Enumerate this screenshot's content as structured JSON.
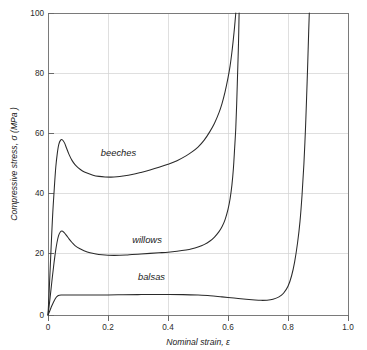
{
  "chart_data": {
    "type": "line",
    "title": "",
    "xlabel": "Nominal strain, ε",
    "ylabel": "Compressive stress, σ (MPa )",
    "xlim": [
      0,
      1.0
    ],
    "ylim": [
      0,
      100
    ],
    "xticks": [
      "0",
      "0.2",
      "0.4",
      "0.6",
      "0.8",
      "1.0"
    ],
    "xtick_values": [
      0,
      0.2,
      0.4,
      0.6,
      0.8,
      1.0
    ],
    "yticks": [
      "0",
      "20",
      "40",
      "60",
      "80",
      "100"
    ],
    "ytick_values": [
      0,
      20,
      40,
      60,
      80,
      100
    ],
    "grid": true,
    "legend_position": "inline-annotations",
    "line_color": "#2a2a2a",
    "grid_color": "#d2d2d2",
    "axis_color": "#7a7a7a",
    "series": [
      {
        "name": "beeches",
        "label": "beeches",
        "label_x": 0.235,
        "label_y": 52.5,
        "peak_strain": 0.045,
        "peak_stress": 58,
        "plateau_stress": 46,
        "densification_strain": 0.62,
        "points": [
          [
            0.0,
            0.0
          ],
          [
            0.004,
            8.0
          ],
          [
            0.008,
            17.0
          ],
          [
            0.012,
            26.0
          ],
          [
            0.016,
            34.0
          ],
          [
            0.021,
            42.0
          ],
          [
            0.026,
            49.0
          ],
          [
            0.031,
            53.5
          ],
          [
            0.036,
            56.5
          ],
          [
            0.042,
            57.9
          ],
          [
            0.048,
            58.0
          ],
          [
            0.055,
            57.0
          ],
          [
            0.062,
            55.2
          ],
          [
            0.07,
            53.2
          ],
          [
            0.08,
            51.2
          ],
          [
            0.09,
            49.8
          ],
          [
            0.1,
            48.8
          ],
          [
            0.115,
            47.7
          ],
          [
            0.13,
            47.0
          ],
          [
            0.15,
            46.3
          ],
          [
            0.17,
            45.9
          ],
          [
            0.19,
            45.7
          ],
          [
            0.21,
            45.65
          ],
          [
            0.23,
            45.75
          ],
          [
            0.25,
            46.0
          ],
          [
            0.28,
            46.5
          ],
          [
            0.31,
            47.2
          ],
          [
            0.34,
            48.0
          ],
          [
            0.37,
            48.9
          ],
          [
            0.4,
            49.9
          ],
          [
            0.43,
            51.1
          ],
          [
            0.46,
            52.7
          ],
          [
            0.48,
            54.0
          ],
          [
            0.5,
            55.6
          ],
          [
            0.52,
            57.8
          ],
          [
            0.54,
            60.8
          ],
          [
            0.555,
            63.5
          ],
          [
            0.57,
            67.0
          ],
          [
            0.58,
            70.0
          ],
          [
            0.59,
            73.8
          ],
          [
            0.6,
            78.5
          ],
          [
            0.607,
            82.5
          ],
          [
            0.613,
            87.0
          ],
          [
            0.618,
            91.5
          ],
          [
            0.622,
            95.5
          ],
          [
            0.626,
            100.0
          ]
        ]
      },
      {
        "name": "willows",
        "label": "willows",
        "label_x": 0.33,
        "label_y": 23.8,
        "peak_strain": 0.045,
        "peak_stress": 27.8,
        "plateau_stress": 19.8,
        "densification_strain": 0.635,
        "points": [
          [
            0.0,
            0.0
          ],
          [
            0.005,
            4.0
          ],
          [
            0.01,
            8.5
          ],
          [
            0.015,
            13.0
          ],
          [
            0.02,
            17.2
          ],
          [
            0.025,
            21.0
          ],
          [
            0.03,
            24.0
          ],
          [
            0.035,
            26.2
          ],
          [
            0.041,
            27.5
          ],
          [
            0.047,
            27.8
          ],
          [
            0.054,
            27.3
          ],
          [
            0.062,
            26.3
          ],
          [
            0.07,
            25.2
          ],
          [
            0.08,
            24.0
          ],
          [
            0.09,
            23.0
          ],
          [
            0.105,
            22.0
          ],
          [
            0.12,
            21.3
          ],
          [
            0.14,
            20.6
          ],
          [
            0.16,
            20.2
          ],
          [
            0.18,
            19.95
          ],
          [
            0.2,
            19.8
          ],
          [
            0.22,
            19.75
          ],
          [
            0.24,
            19.78
          ],
          [
            0.26,
            19.85
          ],
          [
            0.28,
            20.0
          ],
          [
            0.31,
            20.2
          ],
          [
            0.34,
            20.4
          ],
          [
            0.37,
            20.6
          ],
          [
            0.4,
            20.8
          ],
          [
            0.43,
            21.1
          ],
          [
            0.46,
            21.5
          ],
          [
            0.48,
            21.9
          ],
          [
            0.5,
            22.5
          ],
          [
            0.52,
            23.3
          ],
          [
            0.54,
            24.5
          ],
          [
            0.555,
            25.8
          ],
          [
            0.57,
            27.6
          ],
          [
            0.58,
            29.2
          ],
          [
            0.59,
            31.5
          ],
          [
            0.6,
            35.0
          ],
          [
            0.607,
            38.5
          ],
          [
            0.613,
            43.0
          ],
          [
            0.618,
            48.5
          ],
          [
            0.622,
            55.0
          ],
          [
            0.626,
            62.0
          ],
          [
            0.629,
            70.0
          ],
          [
            0.632,
            80.0
          ],
          [
            0.635,
            90.0
          ],
          [
            0.637,
            100.0
          ]
        ]
      },
      {
        "name": "balsas",
        "label": "balsas",
        "label_x": 0.345,
        "label_y": 11.5,
        "peak_strain": 0.04,
        "peak_stress": 6.6,
        "plateau_stress": 6.5,
        "densification_strain": 0.86,
        "points": [
          [
            0.0,
            0.0
          ],
          [
            0.004,
            0.9
          ],
          [
            0.008,
            1.9
          ],
          [
            0.012,
            2.9
          ],
          [
            0.017,
            4.0
          ],
          [
            0.022,
            5.0
          ],
          [
            0.027,
            5.8
          ],
          [
            0.032,
            6.3
          ],
          [
            0.038,
            6.55
          ],
          [
            0.045,
            6.6
          ],
          [
            0.06,
            6.6
          ],
          [
            0.08,
            6.6
          ],
          [
            0.11,
            6.6
          ],
          [
            0.15,
            6.62
          ],
          [
            0.2,
            6.65
          ],
          [
            0.25,
            6.7
          ],
          [
            0.3,
            6.75
          ],
          [
            0.35,
            6.8
          ],
          [
            0.4,
            6.8
          ],
          [
            0.45,
            6.75
          ],
          [
            0.5,
            6.6
          ],
          [
            0.54,
            6.4
          ],
          [
            0.58,
            6.0
          ],
          [
            0.62,
            5.6
          ],
          [
            0.66,
            5.2
          ],
          [
            0.69,
            4.95
          ],
          [
            0.71,
            4.85
          ],
          [
            0.73,
            4.9
          ],
          [
            0.75,
            5.2
          ],
          [
            0.77,
            6.0
          ],
          [
            0.785,
            7.2
          ],
          [
            0.8,
            9.5
          ],
          [
            0.812,
            13.0
          ],
          [
            0.822,
            17.5
          ],
          [
            0.832,
            24.0
          ],
          [
            0.84,
            31.0
          ],
          [
            0.847,
            40.0
          ],
          [
            0.853,
            50.0
          ],
          [
            0.858,
            61.0
          ],
          [
            0.862,
            72.0
          ],
          [
            0.866,
            84.0
          ],
          [
            0.869,
            94.0
          ],
          [
            0.871,
            100.0
          ]
        ]
      }
    ]
  }
}
